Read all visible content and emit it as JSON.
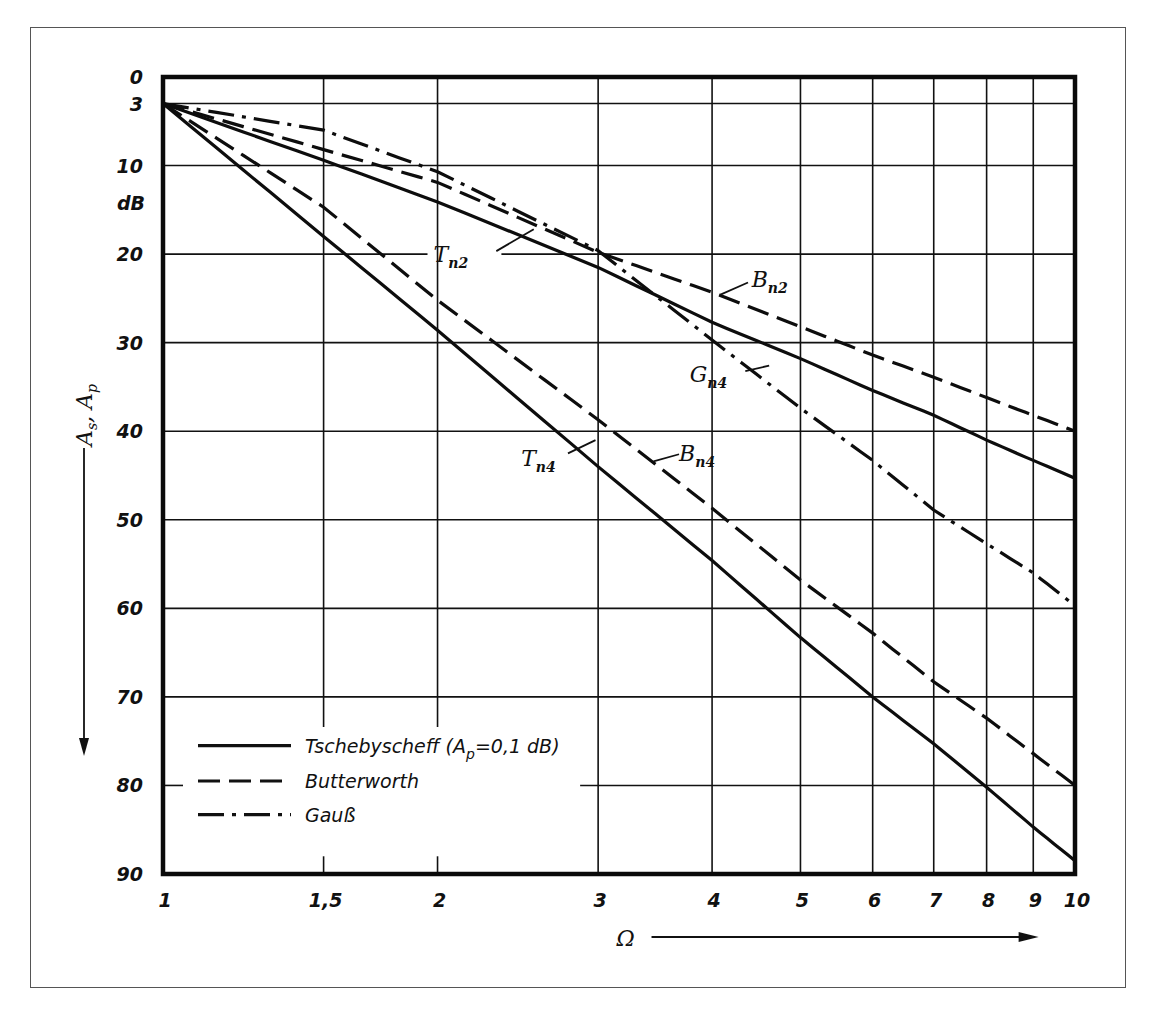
{
  "chart_data": {
    "type": "line",
    "title": "",
    "xlabel": "Ω",
    "ylabel": "A_s, A_p",
    "yunit": "dB",
    "xscale": "log",
    "xlim": [
      1,
      10
    ],
    "ylim": [
      0,
      90
    ],
    "y_inverted": true,
    "grid": true,
    "x_ticks": [
      {
        "v": 1,
        "label": "1"
      },
      {
        "v": 1.5,
        "label": "1,5"
      },
      {
        "v": 2,
        "label": "2"
      },
      {
        "v": 3,
        "label": "3"
      },
      {
        "v": 4,
        "label": "4"
      },
      {
        "v": 5,
        "label": "5"
      },
      {
        "v": 6,
        "label": "6"
      },
      {
        "v": 7,
        "label": "7"
      },
      {
        "v": 8,
        "label": "8"
      },
      {
        "v": 9,
        "label": "9"
      },
      {
        "v": 10,
        "label": "10"
      }
    ],
    "y_ticks": [
      {
        "v": 0,
        "label": "0"
      },
      {
        "v": 3,
        "label": "3"
      },
      {
        "v": 10,
        "label": "10"
      },
      {
        "v": 20,
        "label": "20"
      },
      {
        "v": 30,
        "label": "30"
      },
      {
        "v": 40,
        "label": "40"
      },
      {
        "v": 50,
        "label": "50"
      },
      {
        "v": 60,
        "label": "60"
      },
      {
        "v": 70,
        "label": "70"
      },
      {
        "v": 80,
        "label": "80"
      },
      {
        "v": 90,
        "label": "90"
      }
    ],
    "x": [
      1,
      1.5,
      2,
      3,
      4,
      5,
      6,
      7,
      8,
      9,
      10
    ],
    "series": [
      {
        "name": "T_n2",
        "family": "Tschebyscheff",
        "order": 2,
        "style": "solid",
        "values": [
          3,
          9.4,
          14.1,
          21.5,
          27.7,
          31.8,
          35.4,
          38.2,
          41.0,
          43.3,
          45.3
        ],
        "label_at": {
          "x": 2.05,
          "y": 20
        }
      },
      {
        "name": "T_n4",
        "family": "Tschebyscheff",
        "order": 4,
        "style": "solid",
        "values": [
          3,
          18.0,
          28.6,
          44.0,
          54.6,
          63.3,
          70.0,
          75.3,
          80.2,
          84.7,
          88.5
        ],
        "label_at": {
          "x": 2.55,
          "y": 42
        }
      },
      {
        "name": "B_n2",
        "family": "Butterworth",
        "order": 2,
        "style": "dashed",
        "values": [
          3,
          8.2,
          11.9,
          19.8,
          24.3,
          28.2,
          31.4,
          33.9,
          36.2,
          38.2,
          40.0
        ],
        "label_at": {
          "x": 4.5,
          "y": 23.5
        }
      },
      {
        "name": "B_n4",
        "family": "Butterworth",
        "order": 4,
        "style": "dashed",
        "values": [
          3,
          14.7,
          25.2,
          38.7,
          48.7,
          56.8,
          62.8,
          68.3,
          72.4,
          76.4,
          80.0
        ],
        "label_at": {
          "x": 3.55,
          "y": 43
        }
      },
      {
        "name": "G_n4",
        "family": "Gauß",
        "order": 4,
        "style": "dashdot",
        "values": [
          3,
          6.0,
          10.7,
          19.6,
          29.7,
          37.4,
          43.3,
          48.9,
          52.7,
          56.0,
          59.7
        ],
        "label_at": {
          "x": 4.0,
          "y": 36
        }
      }
    ],
    "curve_labels": [
      {
        "main": "T",
        "sub": "n2"
      },
      {
        "main": "T",
        "sub": "n4"
      },
      {
        "main": "B",
        "sub": "n2"
      },
      {
        "main": "B",
        "sub": "n4"
      },
      {
        "main": "G",
        "sub": "n4"
      }
    ],
    "legend": {
      "position": "lower-left",
      "entries": [
        {
          "style": "solid",
          "label": "Tschebyscheff (A",
          "label_sub": "p",
          "label_tail": "=0,1 dB)"
        },
        {
          "style": "dashed",
          "label": "Butterworth"
        },
        {
          "style": "dashdot",
          "label": "Gauß"
        }
      ]
    }
  },
  "axis": {
    "y_title_main_1": "A",
    "y_title_sub_1": "s",
    "y_title_sep": ",",
    "y_title_main_2": "A",
    "y_title_sub_2": "p",
    "y_unit": "dB",
    "x_title": "Ω"
  }
}
